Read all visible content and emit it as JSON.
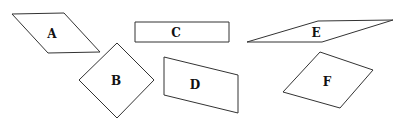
{
  "diagram": {
    "shapes": [
      {
        "id": "A",
        "label": "A",
        "kind": "parallelogram",
        "points": "12,14 64,13 100,52 48,53",
        "label_pos": [
          52,
          34
        ]
      },
      {
        "id": "B",
        "label": "B",
        "kind": "square-rotated",
        "points": "117,43 154,80 117,118 79,80",
        "label_pos": [
          116,
          81
        ]
      },
      {
        "id": "C",
        "label": "C",
        "kind": "rectangle",
        "points": "135,22 229,22 229,42 135,42",
        "label_pos": [
          176,
          33
        ]
      },
      {
        "id": "D",
        "label": "D",
        "kind": "parallelogram",
        "points": "164,57 238,75 238,113 164,95",
        "label_pos": [
          195,
          85
        ]
      },
      {
        "id": "E",
        "label": "E",
        "kind": "parallelogram",
        "points": "247,42 318,21 393,20 322,42",
        "label_pos": [
          316,
          33
        ]
      },
      {
        "id": "F",
        "label": "F",
        "kind": "rhombus",
        "points": "320,52 373,70 340,108 283,92",
        "label_pos": [
          327,
          82
        ]
      }
    ]
  }
}
